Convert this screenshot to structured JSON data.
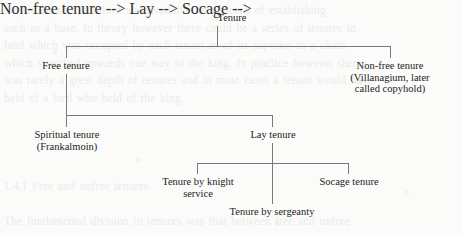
{
  "diagram": {
    "type": "tree",
    "title_node": "Tenure",
    "background_text": "the tenant and therefore was available as a means of establishing\nsuch as a base. In theory however there could be a series of tenures in\nland which was occupied by each tenant as of its superior in a chain\nwhich stretched upwards one way to the king. In practice however there\nwas rarely a great depth of tenures and in most cases a tenant would have\nheld of a lord who held of the king.\n\n\n\n\n1.4.1 Free and unfree tenures\n\nThe fundamental division in tenures was that between free and unfree\ntenure. A free tenure was one whose services were certain, and in\nconsequence the tenant enjoyed the protection of the royal courts. A\ntenant in villeinage by contrast held at the will of the lord, on terms\nwhich could be varied at will, and was subject only to the jurisdiction\nof the manorial court.",
    "nodes": [
      {
        "id": "tenure",
        "label": "Tenure"
      },
      {
        "id": "free",
        "label": "Free tenure"
      },
      {
        "id": "nonfree",
        "label": "Non-free tenure\n(Villanagium, later\ncalled copyhold)"
      },
      {
        "id": "spiritual",
        "label": "Spiritual tenure\n(Frankalmoin)"
      },
      {
        "id": "lay",
        "label": "Lay tenure"
      },
      {
        "id": "knight",
        "label": "Tenure by knight\nservice"
      },
      {
        "id": "socage",
        "label": "Socage tenure"
      },
      {
        "id": "sergeanty",
        "label": "Tenure by sergeanty"
      }
    ],
    "edges": [
      {
        "from": "tenure",
        "to": "free"
      },
      {
        "from": "tenure",
        "to": "nonfree"
      },
      {
        "from": "free",
        "to": "spiritual"
      },
      {
        "from": "free",
        "to": "lay"
      },
      {
        "from": "lay",
        "to": "knight"
      },
      {
        "from": "lay",
        "to": "socage"
      },
      {
        "from": "lay",
        "to": "sergeanty"
      }
    ],
    "line_color": "#7a7a7a",
    "text_color": "#232323",
    "page_background": "#fbfbfa"
  }
}
